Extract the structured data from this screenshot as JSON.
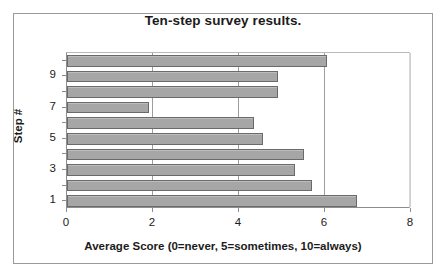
{
  "chart_data": {
    "type": "bar",
    "orientation": "horizontal",
    "title": "Ten-step survey results.",
    "xlabel": "Average Score (0=never, 5=sometimes, 10=always)",
    "ylabel": "Step #",
    "categories": [
      "1",
      "2",
      "3",
      "4",
      "5",
      "6",
      "7",
      "8",
      "9",
      "10"
    ],
    "values": [
      6.75,
      5.7,
      5.3,
      5.5,
      4.55,
      4.35,
      1.9,
      4.9,
      4.9,
      6.05
    ],
    "series": [
      {
        "name": "Average Score",
        "values": [
          6.75,
          5.7,
          5.3,
          5.5,
          4.55,
          4.35,
          1.9,
          4.9,
          4.9,
          6.05
        ]
      }
    ],
    "xlim": [
      0,
      8
    ],
    "xticks": [
      "0",
      "2",
      "4",
      "6",
      "8"
    ],
    "xtick_values": [
      0,
      2,
      4,
      6,
      8
    ],
    "yticks": [
      "1",
      "3",
      "5",
      "7",
      "9"
    ],
    "ytick_values": [
      1,
      3,
      5,
      7,
      9
    ],
    "grid": "vertical",
    "legend": "none",
    "bar_color": "#a6a6a6",
    "bar_border_color": "#6a6a6a",
    "background_color": "#ffffff",
    "frame_color": "#9a9a9a"
  }
}
